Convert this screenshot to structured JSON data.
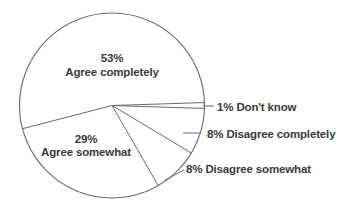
{
  "chart_data": {
    "type": "pie",
    "title": "",
    "legend": "none",
    "total_pct": 99,
    "slices": [
      {
        "label": "Don't know",
        "value": 1,
        "pct_text": "1%",
        "label_placement": "outside"
      },
      {
        "label": "Disagree completely",
        "value": 8,
        "pct_text": "8%",
        "label_placement": "outside"
      },
      {
        "label": "Disagree somewhat",
        "value": 8,
        "pct_text": "8%",
        "label_placement": "outside"
      },
      {
        "label": "Agree somewhat",
        "value": 29,
        "pct_text": "29%",
        "label_placement": "inside"
      },
      {
        "label": "Agree completely",
        "value": 53,
        "pct_text": "53%",
        "label_placement": "inside"
      }
    ],
    "colors": {
      "slice_fill": "#ffffff",
      "line_stroke": "#6a6a6a",
      "text": "#3a3a3a",
      "background": "#ffffff"
    }
  }
}
